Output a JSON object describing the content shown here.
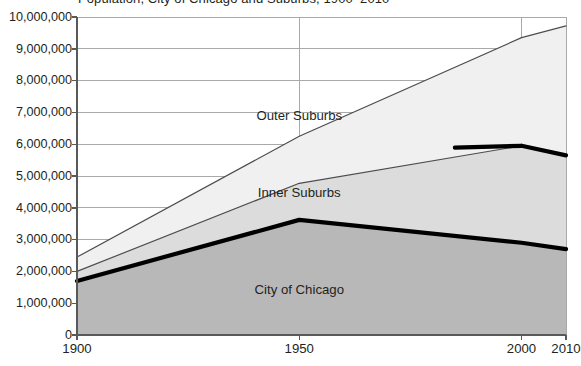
{
  "chart_data": {
    "type": "area",
    "title": "Population, City of Chicago and Suburbs, 1900–2010",
    "xlabel": "",
    "ylabel": "",
    "x": [
      1900,
      1950,
      2000,
      2010
    ],
    "xticks": [
      "1900",
      "1950",
      "2000",
      "2010"
    ],
    "xlim": [
      1900,
      2010
    ],
    "ylim": [
      0,
      10000000
    ],
    "yticks": [
      "10,000,000",
      "9,000,000",
      "8,000,000",
      "7,000,000",
      "6,000,000",
      "5,000,000",
      "4,000,000",
      "3,000,000",
      "2,000,000",
      "1,000,000",
      "0"
    ],
    "ytick_values": [
      10000000,
      9000000,
      8000000,
      7000000,
      6000000,
      5000000,
      4000000,
      3000000,
      2000000,
      1000000,
      0
    ],
    "grid": true,
    "legend": "inline-labels",
    "stacked": true,
    "series": [
      {
        "name": "City of Chicago",
        "values": [
          1700000,
          3620000,
          2900000,
          2700000
        ],
        "fill": "#b8b8b8",
        "line": "#000000",
        "line_width": 4.2,
        "label_x": 1950,
        "label_y": 1400000
      },
      {
        "name": "Inner Suburbs",
        "values": [
          300000,
          1150000,
          3050000,
          2950000
        ],
        "cumulative": [
          2000000,
          4770000,
          5950000,
          5650000
        ],
        "fill": "#dcdcdc",
        "line": "#4d4d4d",
        "line_width": 1.2,
        "line_width_highlight": 4.2,
        "label_x": 1950,
        "label_y": 4450000
      },
      {
        "name": "Outer Suburbs",
        "values": [
          450000,
          1480000,
          3400000,
          4070000
        ],
        "cumulative": [
          2450000,
          6250000,
          9350000,
          9720000
        ],
        "fill": "#f0f0f0",
        "line": "#4d4d4d",
        "line_width": 1.2,
        "label_x": 1950,
        "label_y": 6900000
      }
    ],
    "annotations": []
  },
  "axis": {
    "axis_color": "#58595b",
    "grid_color": "#a7a9ac",
    "text_color": "#231f20"
  }
}
